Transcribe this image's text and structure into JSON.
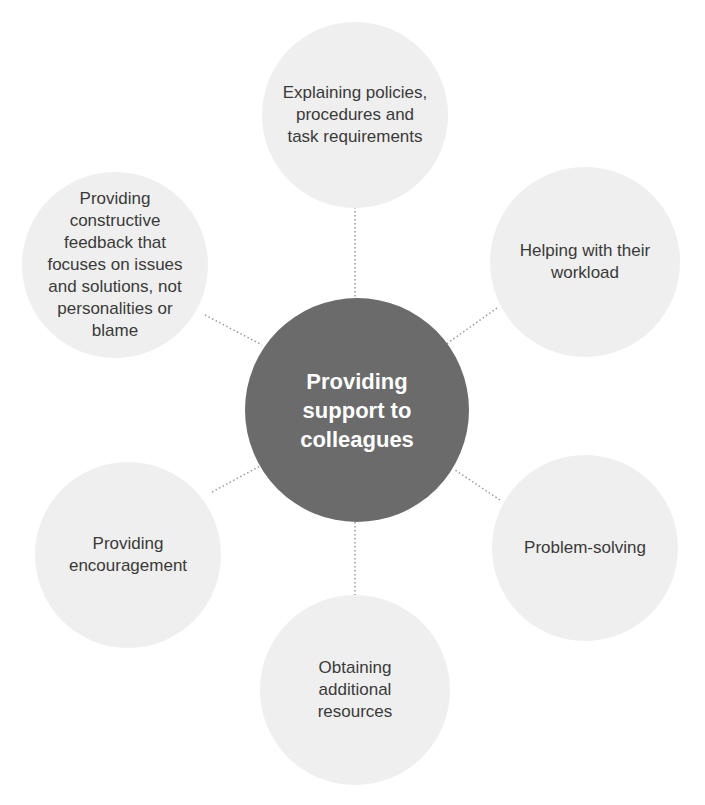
{
  "diagram": {
    "type": "hub-and-spoke",
    "colors": {
      "center_fill": "#6b6b6b",
      "center_text": "#ffffff",
      "outer_fill": "#efefef",
      "outer_text": "#3a3a3a",
      "connector": "#9a9a9a"
    },
    "center": {
      "label": "Providing\nsupport to\ncolleagues"
    },
    "nodes": [
      {
        "id": "top",
        "label": "Explaining policies,\nprocedures and\ntask requirements"
      },
      {
        "id": "top-right",
        "label": "Helping with their\nworkload"
      },
      {
        "id": "bottom-right",
        "label": "Problem-solving"
      },
      {
        "id": "bottom",
        "label": "Obtaining\nadditional\nresources"
      },
      {
        "id": "bottom-left",
        "label": "Providing\nencouragement"
      },
      {
        "id": "top-left",
        "label": "Providing\nconstructive\nfeedback that\nfocuses on issues\nand solutions, not\npersonalities or\nblame"
      }
    ]
  }
}
